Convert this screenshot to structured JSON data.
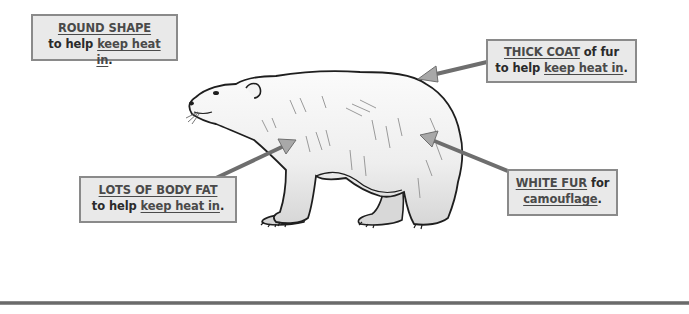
{
  "diagram": {
    "labels": [
      {
        "id": "round-shape",
        "line1_key": "ROUND SHAPE",
        "line1_rest": "",
        "line2_prefix": "to help ",
        "line2_key": "keep heat in",
        "line2_suffix": "."
      },
      {
        "id": "thick-coat",
        "line1_key": "THICK COAT",
        "line1_rest": " of fur",
        "line2_prefix": "to help ",
        "line2_key": "keep heat in",
        "line2_suffix": "."
      },
      {
        "id": "body-fat",
        "line1_key": "LOTS OF BODY FAT",
        "line1_rest": "",
        "line2_prefix": "to help ",
        "line2_key": "keep heat in",
        "line2_suffix": "."
      },
      {
        "id": "white-fur",
        "line1_key": "WHITE FUR",
        "line1_rest": " for",
        "line2_prefix": "",
        "line2_key": "camouflage",
        "line2_suffix": "."
      }
    ],
    "colors": {
      "box_fill": "#e9e9e9",
      "box_border": "#8a8a8a",
      "arrow": "#7a7a7a",
      "text": "#2e2e2e"
    }
  }
}
